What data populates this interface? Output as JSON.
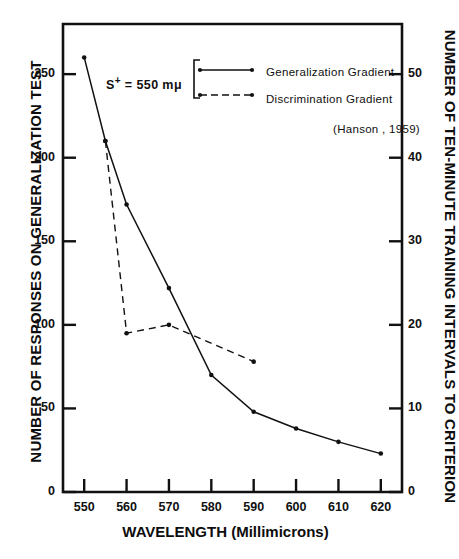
{
  "chart_data": {
    "type": "line",
    "title": "",
    "xlabel": "WAVELENGTH (Millimicrons)",
    "ylabel": "NUMBER OF RESPONSES ON GENERALIZATION TEST",
    "ylabel_right": "NUMBER OF TEN-MINUTE TRAINING INTERVALS TO CRITERION",
    "xlim": [
      545,
      625
    ],
    "ylim": [
      0,
      280
    ],
    "ylim_right": [
      0,
      56
    ],
    "grid": false,
    "legend_position": "top-center",
    "xticks": [
      550,
      560,
      570,
      580,
      590,
      600,
      610,
      620
    ],
    "xtick_labels": [
      "550",
      "560",
      "570",
      "580",
      "590",
      "600",
      "610",
      "620"
    ],
    "yticks": [
      0,
      50,
      100,
      150,
      200,
      250
    ],
    "ytick_labels": [
      "0",
      "50",
      "100",
      "150",
      "200",
      "250"
    ],
    "yticks_right": [
      0,
      10,
      20,
      30,
      40,
      50
    ],
    "ytick_labels_right": [
      "0",
      "10",
      "20",
      "30",
      "40",
      "50"
    ],
    "annotation": "S+ = 550 mμ",
    "annotation_parts": {
      "prefix": "S",
      "sup": "+",
      "rest": " = 550 mμ"
    },
    "credit": "(Hanson , 1959)",
    "series": [
      {
        "name": "Generalization Gradient",
        "style": "solid",
        "axis": "left",
        "x": [
          550,
          555,
          560,
          570,
          580,
          590,
          600,
          610,
          620
        ],
        "values": [
          260,
          210,
          172,
          122,
          70,
          48,
          38,
          30,
          23
        ]
      },
      {
        "name": "Discrimination Gradient",
        "style": "dashed",
        "axis": "left",
        "x": [
          555,
          560,
          570,
          590
        ],
        "values": [
          210,
          95,
          100,
          78
        ]
      }
    ]
  },
  "legend": {
    "items": [
      {
        "label": "Generalization Gradient",
        "style": "solid"
      },
      {
        "label": "Discrimination Gradient",
        "style": "dashed"
      }
    ],
    "credit": "(Hanson , 1959)"
  },
  "axes": {
    "x_title": "WAVELENGTH (Millimicrons)",
    "y_title_left": "NUMBER OF RESPONSES ON GENERALIZATION TEST",
    "y_title_right": "NUMBER OF TEN-MINUTE TRAINING INTERVALS TO CRITERION"
  },
  "colors": {
    "ink": "#111111",
    "background": "#ffffff"
  }
}
